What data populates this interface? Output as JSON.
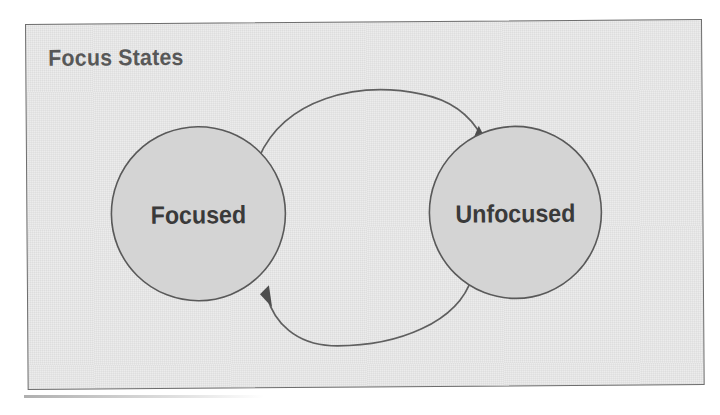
{
  "panel": {
    "title": "Focus States",
    "background_color": "#ececec",
    "border_color": "#6e6e6e"
  },
  "diagram": {
    "type": "state-transition-diagram",
    "node_fill_color": "#d4d4d4",
    "node_stroke_color": "#595959",
    "arrow_color": "#5f5f5f",
    "label_color": "#3a3a3a",
    "states": [
      {
        "id": "focused",
        "label": "Focused",
        "cx": 171,
        "cy": 190,
        "r": 87
      },
      {
        "id": "unfocused",
        "label": "Unfocused",
        "cx": 488,
        "cy": 191,
        "r": 86
      }
    ],
    "transitions": [
      {
        "id": "focused-to-unfocused",
        "from": "focused",
        "to": "unfocused",
        "label": "",
        "direction": "top-arc-right"
      },
      {
        "id": "unfocused-to-focused",
        "from": "unfocused",
        "to": "focused",
        "label": "",
        "direction": "bottom-arc-left"
      }
    ]
  }
}
